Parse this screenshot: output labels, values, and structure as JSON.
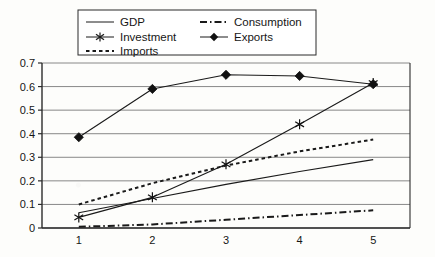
{
  "chart_data": {
    "type": "line",
    "title": "",
    "xlabel": "",
    "ylabel": "",
    "categories": [
      "1",
      "2",
      "3",
      "4",
      "5"
    ],
    "ylim": [
      0,
      0.7
    ],
    "yticks": [
      "0",
      "0.1",
      "0.2",
      "0.3",
      "0.4",
      "0.5",
      "0.6",
      "0.7"
    ],
    "ytick_values": [
      0,
      0.1,
      0.2,
      0.3,
      0.4,
      0.5,
      0.6,
      0.7
    ],
    "grid": "horizontal",
    "legend_position": "top",
    "series": [
      {
        "name": "GDP",
        "values": [
          0.065,
          0.125,
          0.185,
          0.24,
          0.29
        ],
        "style": "solid",
        "marker": "none"
      },
      {
        "name": "Consumption",
        "values": [
          0.005,
          0.015,
          0.035,
          0.055,
          0.075
        ],
        "style": "dash-dot",
        "marker": "none"
      },
      {
        "name": "Investment",
        "values": [
          0.045,
          0.13,
          0.27,
          0.44,
          0.615
        ],
        "style": "solid",
        "marker": "star"
      },
      {
        "name": "Exports",
        "values": [
          0.385,
          0.59,
          0.65,
          0.645,
          0.61
        ],
        "style": "solid",
        "marker": "diamond"
      },
      {
        "name": "Imports",
        "values": [
          0.1,
          0.19,
          0.265,
          0.325,
          0.375
        ],
        "style": "dotted",
        "marker": "none"
      }
    ]
  },
  "legend": {
    "entries": [
      {
        "label": "GDP"
      },
      {
        "label": "Consumption"
      },
      {
        "label": "Investment"
      },
      {
        "label": "Exports"
      },
      {
        "label": "Imports"
      }
    ]
  },
  "colors": {
    "line": "#1a1a1a",
    "grid": "#7a7a7a",
    "axis": "#2b2b2b",
    "background": "#fdfdfb",
    "legend_border": "#2b2b2b"
  }
}
